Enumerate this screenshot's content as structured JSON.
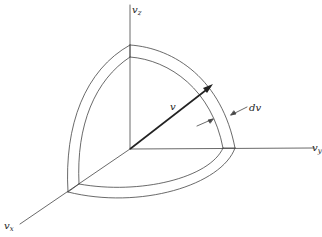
{
  "figure": {
    "type": "velocity-space spherical shell (first octant)",
    "axes": {
      "x": {
        "label": "v",
        "subscript": "x"
      },
      "y": {
        "label": "v",
        "subscript": "y"
      },
      "z": {
        "label": "v",
        "subscript": "z"
      }
    },
    "vector": {
      "label": "v"
    },
    "shell_thickness": {
      "label": "dv"
    },
    "colors": {
      "ink": "#333333",
      "background": "#ffffff"
    }
  }
}
